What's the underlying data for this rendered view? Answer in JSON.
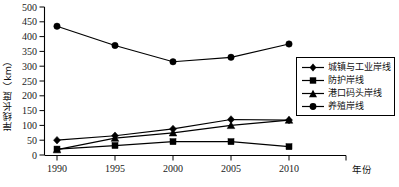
{
  "chart_data": {
    "type": "line",
    "title": "",
    "xlabel": "年份",
    "ylabel": "岸线长度（km）",
    "categories": [
      "1990",
      "1995",
      "2000",
      "2005",
      "2010"
    ],
    "x": [
      1990,
      1995,
      2000,
      2005,
      2010
    ],
    "ylim": [
      0,
      500
    ],
    "ytick_step": 50,
    "yticks": [
      "0",
      "50",
      "100",
      "150",
      "200",
      "250",
      "300",
      "350",
      "400",
      "450",
      "500"
    ],
    "grid": false,
    "legend_position": "right-middle",
    "series": [
      {
        "name": "城镇与工业岸线",
        "marker": "diamond",
        "values": [
          50,
          65,
          88,
          120,
          118
        ]
      },
      {
        "name": "防护岸线",
        "marker": "square",
        "values": [
          20,
          32,
          45,
          45,
          28
        ]
      },
      {
        "name": "港口码头岸线",
        "marker": "triangle",
        "values": [
          18,
          57,
          75,
          100,
          118
        ]
      },
      {
        "name": "养殖岸线",
        "marker": "circle",
        "values": [
          435,
          370,
          315,
          330,
          375
        ]
      }
    ],
    "colors": {
      "line": "#000000",
      "marker": "#000000",
      "axis": "#000000",
      "background": "#ffffff"
    }
  },
  "legend": {
    "items": [
      {
        "label": "城镇与工业岸线",
        "marker": "diamond"
      },
      {
        "label": "防护岸线",
        "marker": "square"
      },
      {
        "label": "港口码头岸线",
        "marker": "triangle"
      },
      {
        "label": "养殖岸线",
        "marker": "circle"
      }
    ]
  },
  "axes": {
    "y_title": "岸线长度（km）",
    "x_title": "年份"
  }
}
